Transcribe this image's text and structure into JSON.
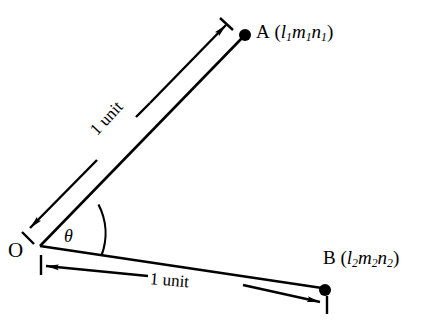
{
  "figure": {
    "background_color": "#ffffff",
    "ink_color": "#000000",
    "width": 432,
    "height": 327
  },
  "labels": {
    "origin": "O",
    "angle": "θ",
    "point_a": {
      "name": "A",
      "open_paren": "(",
      "l": "l",
      "l_sub": "1",
      "m": "m",
      "m_sub": "1",
      "n": "n",
      "n_sub": "1",
      "close_paren": ")"
    },
    "point_b": {
      "name": "B",
      "open_paren": "(",
      "l": "l",
      "l_sub": "2",
      "m": "m",
      "m_sub": "2",
      "n": "n",
      "n_sub": "2",
      "close_paren": ")"
    },
    "length_oa": "1 unit",
    "length_ob": "1 unit"
  },
  "geometry": {
    "origin_point": [
      40,
      246
    ],
    "point_a": [
      245,
      35
    ],
    "point_b": [
      325,
      290
    ],
    "angle_arc_label": "θ",
    "ray_oa_length_label": "1 unit",
    "ray_ob_length_label": "1 unit"
  }
}
